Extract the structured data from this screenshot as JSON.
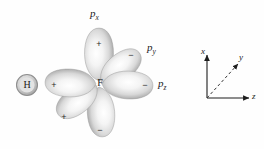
{
  "figure": {
    "kind": "orbital-diagram",
    "background_color": "#fefefe"
  },
  "atoms": [
    {
      "id": "hydrogen",
      "symbol": "H",
      "x": 27,
      "y": 85,
      "radius": 10.5,
      "fill": "#d2d2d2",
      "ring": "#9a9a9a"
    },
    {
      "id": "fluorine",
      "symbol": "F",
      "x": 99,
      "y": 84
    }
  ],
  "lobes": [
    {
      "id": "lobe-up",
      "sign": "+",
      "angle": -90,
      "sign_x": 99,
      "sign_y": 44,
      "label": null
    },
    {
      "id": "lobe-upper-right",
      "sign": "−",
      "angle": -38,
      "sign_x": 131,
      "sign_y": 55,
      "label": "p_y"
    },
    {
      "id": "lobe-right",
      "sign": "−",
      "angle": 2,
      "sign_x": 145,
      "sign_y": 85,
      "label": "p_z"
    },
    {
      "id": "lobe-down",
      "sign": "−",
      "angle": 86,
      "sign_x": 100,
      "sign_y": 130,
      "label": null
    },
    {
      "id": "lobe-lower-left",
      "sign": "+",
      "angle": 143,
      "sign_x": 64,
      "sign_y": 117,
      "label": null
    },
    {
      "id": "lobe-left",
      "sign": "+",
      "angle": 182,
      "sign_x": 54,
      "sign_y": 85,
      "label": null
    }
  ],
  "orbital_labels": [
    {
      "id": "label-px",
      "base": "p",
      "sub": "x",
      "x": 90,
      "y": 10
    },
    {
      "id": "label-py",
      "base": "p",
      "sub": "y",
      "x": 147,
      "y": 45
    },
    {
      "id": "label-pz",
      "base": "p",
      "sub": "z",
      "x": 158,
      "y": 82
    }
  ],
  "axes": {
    "origin_x": 207,
    "origin_y": 98,
    "ticks": [
      {
        "id": "axis-x",
        "label": "x",
        "style": "solid",
        "label_x": 203,
        "label_y": 50
      },
      {
        "id": "axis-y",
        "label": "y",
        "style": "dashed",
        "label_x": 240,
        "label_y": 55
      },
      {
        "id": "axis-z",
        "label": "z",
        "style": "solid",
        "label_x": 250,
        "label_y": 95
      }
    ]
  }
}
